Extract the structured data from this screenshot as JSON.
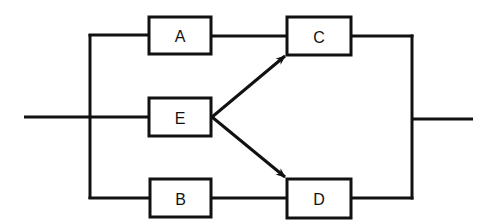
{
  "diagram": {
    "type": "reliability-block-diagram",
    "colors": {
      "stroke": "#111111",
      "background": "#ffffff"
    },
    "blocks": [
      {
        "id": "A",
        "label": "A",
        "x": 149,
        "y": 17,
        "w": 62,
        "h": 37
      },
      {
        "id": "E",
        "label": "E",
        "x": 149,
        "y": 98,
        "w": 62,
        "h": 38
      },
      {
        "id": "B",
        "label": "B",
        "x": 150,
        "y": 179,
        "w": 61,
        "h": 38
      },
      {
        "id": "C",
        "label": "C",
        "x": 287,
        "y": 17,
        "w": 64,
        "h": 38
      },
      {
        "id": "D",
        "label": "D",
        "x": 287,
        "y": 179,
        "w": 64,
        "h": 39
      }
    ],
    "connections": [
      {
        "from": "input",
        "to": "left-bus"
      },
      {
        "from": "left-bus",
        "to": "A"
      },
      {
        "from": "left-bus",
        "to": "E"
      },
      {
        "from": "left-bus",
        "to": "B"
      },
      {
        "from": "A",
        "to": "C"
      },
      {
        "from": "B",
        "to": "D"
      },
      {
        "from": "E",
        "to": "C",
        "arrow": true
      },
      {
        "from": "E",
        "to": "D",
        "arrow": true
      },
      {
        "from": "C",
        "to": "right-bus"
      },
      {
        "from": "D",
        "to": "right-bus"
      },
      {
        "from": "right-bus",
        "to": "output"
      }
    ]
  }
}
